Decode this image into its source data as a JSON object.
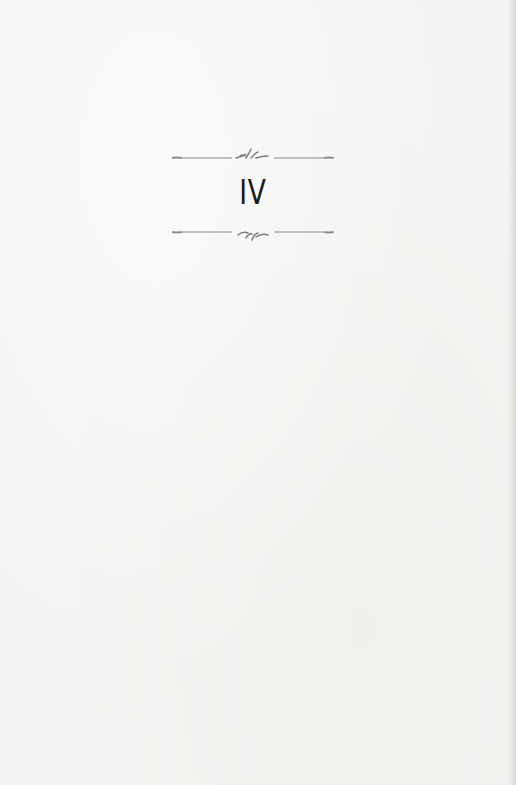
{
  "page": {
    "chapter_heading": "IV",
    "ornaments": {
      "top_rule": "fleuron-rule-up",
      "bottom_rule": "fleuron-rule-down"
    },
    "colors": {
      "paper": "#f3f3f1",
      "ink": "#1a1a1a",
      "ornament": "#8a8a88"
    }
  }
}
